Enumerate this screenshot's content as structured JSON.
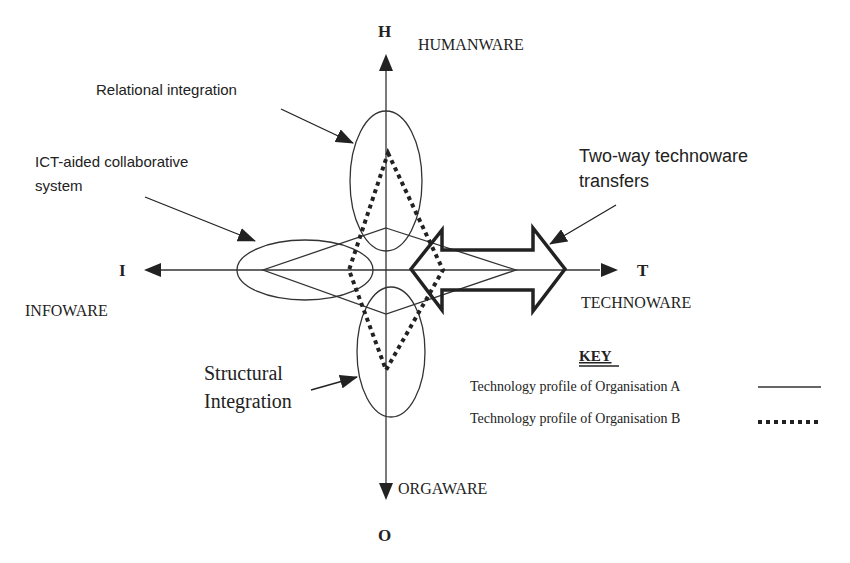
{
  "axes": {
    "top": {
      "letter": "H",
      "name": "HUMANWARE"
    },
    "left": {
      "letter": "I",
      "name": "INFOWARE"
    },
    "right": {
      "letter": "T",
      "name": "TECHNOWARE"
    },
    "bottom": {
      "letter": "O",
      "name": "ORGAWARE"
    }
  },
  "callouts": {
    "relational": "Relational integration",
    "ict_line1": "ICT-aided collaborative",
    "ict_line2": "system",
    "twoway_line1": "Two-way technoware",
    "twoway_line2": "transfers",
    "structural_line1": "Structural",
    "structural_line2": "Integration"
  },
  "key": {
    "title": "KEY",
    "items": [
      {
        "label": "Technology profile of Organisation A",
        "style": "solid"
      },
      {
        "label": "Technology profile of Organisation B",
        "style": "dotted"
      }
    ]
  },
  "profiles": {
    "organisation_a": {
      "H": 228,
      "I": 263,
      "T": 516,
      "O": 314
    },
    "organisation_b": {
      "H": 153,
      "I": 349,
      "T": 443,
      "O": 370
    }
  },
  "colors": {
    "ink": "#222222",
    "background": "#ffffff"
  }
}
